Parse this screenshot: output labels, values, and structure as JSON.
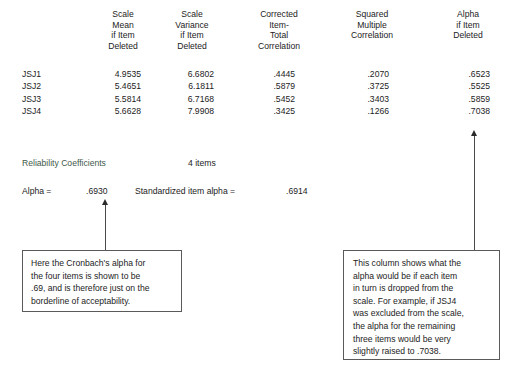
{
  "table": {
    "column_headers": [
      "Scale\nMean\nif Item\nDeleted",
      "Scale\nVariance\nif Item\nDeleted",
      "Corrected\nItem-\nTotal\nCorrelation",
      "Squared\nMultiple\nCorrelation",
      "Alpha\nif Item\nDeleted"
    ],
    "row_labels": [
      "JSJ1",
      "JSJ2",
      "JSJ3",
      "JSJ4"
    ],
    "columns": {
      "scale_mean_if_item_deleted": [
        "4.9535",
        "5.4651",
        "5.5814",
        "5.6628"
      ],
      "scale_variance_if_item_deleted": [
        "6.6802",
        "6.1811",
        "6.7168",
        "7.9908"
      ],
      "corrected_item_total_correlation": [
        ".4445",
        ".5879",
        ".5452",
        ".3425"
      ],
      "squared_multiple_correlation": [
        ".2070",
        ".3725",
        ".3403",
        ".1266"
      ],
      "alpha_if_item_deleted": [
        ".6523",
        ".5525",
        ".5859",
        ".7038"
      ]
    }
  },
  "reliability": {
    "heading": "Reliability Coefficients",
    "n_items": "4 items",
    "alpha_label": "Alpha =",
    "alpha_value": ".6930",
    "standardized_label": "Standardized item alpha =",
    "standardized_value": ".6914"
  },
  "callouts": {
    "left": "Here the Cronbach's alpha for\nthe four items is shown to be\n.69, and is therefore just on the\nborderline of acceptability.",
    "right": "This column shows what the\nalpha would be if each item\nin turn is dropped from the\nscale.  For example, if JSJ4\nwas excluded from the scale,\nthe alpha for the remaining\nthree items would be very\nslightly raised to .7038."
  },
  "colors": {
    "text": "#1c1c1c",
    "heading_green": "#3f5a4a",
    "box_border": "#5a5a5a",
    "arrow": "#2b2b2b",
    "background": "#ffffff"
  }
}
